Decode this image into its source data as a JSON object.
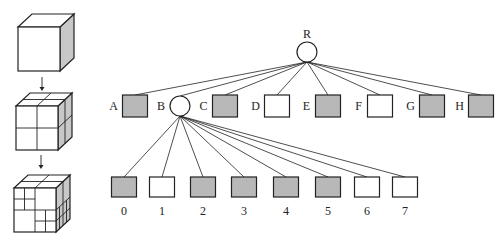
{
  "diagram": {
    "type": "octree-illustration",
    "colors": {
      "stroke": "#222222",
      "filled": "#b8b8b8",
      "empty": "#ffffff",
      "cube_side": "#c8c8c8"
    },
    "cubes": [
      {
        "id": "cube-level-0",
        "description": "undivided cube"
      },
      {
        "id": "cube-level-1",
        "description": "cube subdivided into 8 octants"
      },
      {
        "id": "cube-level-2",
        "description": "cube with some octants further subdivided"
      }
    ],
    "tree": {
      "root": {
        "label": "R",
        "kind": "internal"
      },
      "level1": [
        {
          "label": "A",
          "kind": "leaf",
          "filled": true
        },
        {
          "label": "B",
          "kind": "internal",
          "filled": false
        },
        {
          "label": "C",
          "kind": "leaf",
          "filled": true
        },
        {
          "label": "D",
          "kind": "leaf",
          "filled": false
        },
        {
          "label": "E",
          "kind": "leaf",
          "filled": true
        },
        {
          "label": "F",
          "kind": "leaf",
          "filled": false
        },
        {
          "label": "G",
          "kind": "leaf",
          "filled": true
        },
        {
          "label": "H",
          "kind": "leaf",
          "filled": true
        }
      ],
      "level2_parent": "B",
      "level2": [
        {
          "label": "0",
          "filled": true
        },
        {
          "label": "1",
          "filled": false
        },
        {
          "label": "2",
          "filled": true
        },
        {
          "label": "3",
          "filled": true
        },
        {
          "label": "4",
          "filled": true
        },
        {
          "label": "5",
          "filled": true
        },
        {
          "label": "6",
          "filled": false
        },
        {
          "label": "7",
          "filled": false
        }
      ]
    }
  }
}
